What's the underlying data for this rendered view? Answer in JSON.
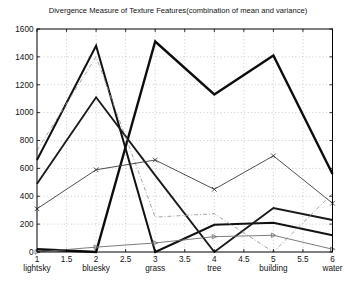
{
  "title": "Divergence Measure of Texture Features(combination of mean and variance)",
  "chart_data": {
    "type": "line",
    "x": [
      1,
      2,
      3,
      4,
      5,
      6
    ],
    "x_tick_labels": [
      "1",
      "1.5",
      "2",
      "2.5",
      "3",
      "3.5",
      "4",
      "4.5",
      "5",
      "5.5",
      "6"
    ],
    "x_ticks": [
      1,
      1.5,
      2,
      2.5,
      3,
      3.5,
      4,
      4.5,
      5,
      5.5,
      6
    ],
    "x_class_labels": [
      "lightsky",
      "bluesky",
      "grass",
      "tree",
      "building",
      "water"
    ],
    "xlabel": "",
    "ylabel": "",
    "ylim": [
      0,
      1600
    ],
    "xlim": [
      1,
      6
    ],
    "y_ticks": [
      0,
      200,
      400,
      600,
      800,
      1000,
      1200,
      1400,
      1600
    ],
    "grid": "dotted",
    "legend": "none",
    "series": [
      {
        "name": "heavy-solid-line",
        "values": [
          20,
          0,
          1510,
          1130,
          1410,
          560
        ],
        "style": "solid",
        "width": 2.4,
        "color": "#0d0d0d",
        "marker": "none"
      },
      {
        "name": "thick-solid-line-a",
        "values": [
          660,
          1480,
          0,
          195,
          210,
          120
        ],
        "style": "solid",
        "width": 2.0,
        "color": "#111111",
        "marker": "none"
      },
      {
        "name": "thick-solid-line-b",
        "values": [
          490,
          1110,
          550,
          0,
          315,
          230
        ],
        "style": "solid",
        "width": 1.9,
        "color": "#1a1a1a",
        "marker": "none"
      },
      {
        "name": "dash-dot-line",
        "values": [
          730,
          1400,
          250,
          275,
          0,
          420
        ],
        "style": "dashdot",
        "width": 0.9,
        "color": "#9a9a9a",
        "marker": "none"
      },
      {
        "name": "x-marker-line",
        "values": [
          310,
          590,
          660,
          450,
          690,
          350
        ],
        "style": "solid",
        "width": 0.9,
        "color": "#3c3c3c",
        "marker": "x"
      },
      {
        "name": "thin-gray-line",
        "values": [
          0,
          35,
          65,
          110,
          120,
          20
        ],
        "style": "solid",
        "width": 0.9,
        "color": "#6e6e6e",
        "marker": "triangle"
      }
    ],
    "plot_box": {
      "left": 37,
      "right": 332.5,
      "top": 29,
      "bottom": 252
    },
    "grid_color": "#b4b4b4",
    "axis_color": "#000000"
  }
}
